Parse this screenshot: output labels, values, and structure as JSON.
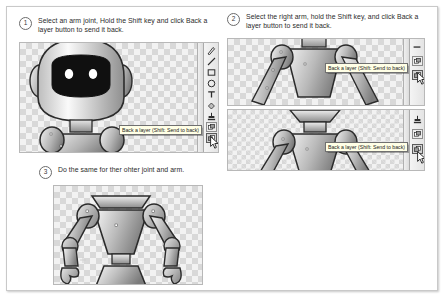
{
  "document": {
    "title": "Robot arm layering tutorial",
    "background_color": "#ffffff",
    "frame_border_color": "#c9c9c9"
  },
  "steps": [
    {
      "number": "1",
      "text": "Select an arm joint, Hold the Shift key and click Back a layer button to send it back."
    },
    {
      "number": "2",
      "text": "Select the right arm, hold the Shift key, and click Back a layer button to send it back."
    },
    {
      "number": "3",
      "text": "Do the same for ther ohter joint and arm."
    }
  ],
  "tooltip": {
    "label": "Back a layer (Shift: Send to back)",
    "background_color": "#ffffe6",
    "border_color": "#707070"
  },
  "toolbar": {
    "name": "drawing-toolbar",
    "tools": [
      {
        "icon": "pen-icon",
        "glyph": "✎",
        "label": "Pen"
      },
      {
        "icon": "line-icon",
        "glyph": "╲",
        "label": "Line"
      },
      {
        "icon": "rectangle-icon",
        "glyph": "▫",
        "label": "Rectangle"
      },
      {
        "icon": "ellipse-icon",
        "glyph": "○",
        "label": "Ellipse"
      },
      {
        "icon": "text-icon",
        "glyph": "T",
        "label": "Text"
      },
      {
        "icon": "fill-bucket-icon",
        "glyph": "⬗",
        "label": "Fill"
      },
      {
        "icon": "stamp-icon",
        "glyph": "⬘",
        "label": "Stamp"
      },
      {
        "icon": "forward-a-layer-icon",
        "glyph": "⬙",
        "label": "Forward a layer"
      },
      {
        "icon": "back-a-layer-icon",
        "glyph": "⬚",
        "label": "Back a layer"
      }
    ],
    "layer_tools": [
      {
        "icon": "forward-a-layer-icon",
        "label": "Forward a layer"
      },
      {
        "icon": "back-a-layer-icon",
        "label": "Back a layer"
      }
    ]
  },
  "canvas": {
    "transparency_checker_light": "#f2f2f2",
    "transparency_checker_dark": "#d8d8d8",
    "border_color": "#b8b8b8"
  },
  "artwork": {
    "subject": "robot",
    "body_fill_light": "#f0f0f0",
    "body_fill_dark": "#8e8e8e",
    "outline_color": "#2b2b2b",
    "visor_color": "#101010",
    "eye_color": "#ffffff"
  }
}
